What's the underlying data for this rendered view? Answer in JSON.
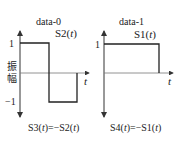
{
  "diagram": {
    "panels": [
      {
        "title": "data-0",
        "signal_label": "S2(t)",
        "signal_name": "S2",
        "signal_var": "t",
        "complement_label": "S3(t)=−S2(t)",
        "y_label": "振幅",
        "y_ticks": [
          "1",
          "−1"
        ],
        "x_label": "t",
        "waveform": [
          {
            "from": 0,
            "to": 0.5,
            "level": 1
          },
          {
            "from": 0.5,
            "to": 1,
            "level": -1
          }
        ]
      },
      {
        "title": "data-1",
        "signal_label": "S1(t)",
        "signal_name": "S1",
        "signal_var": "t",
        "complement_label": "S4(t)=−S1(t)",
        "y_ticks": [
          "1"
        ],
        "x_label": "t",
        "waveform": [
          {
            "from": 0,
            "to": 1,
            "level": 1
          }
        ]
      }
    ],
    "colors": {
      "line": "#222222",
      "axis": "#444444"
    }
  },
  "text": {
    "p0_title": "data-0",
    "p0_sig_name": "S2(",
    "p0_sig_var": "t",
    "p0_sig_close": ")",
    "p0_comp_a": "S3(",
    "p0_comp_b": "t",
    "p0_comp_c": ")=−S2(",
    "p0_comp_d": "t",
    "p0_comp_e": ")",
    "p0_y1": "1",
    "p0_ym1": "−1",
    "p0_ylab1": "振",
    "p0_ylab2": "幅",
    "p0_x": "t",
    "p1_title": "data-1",
    "p1_sig_name": "S1(",
    "p1_sig_var": "t",
    "p1_sig_close": ")",
    "p1_comp_a": "S4(",
    "p1_comp_b": "t",
    "p1_comp_c": ")=−S1(",
    "p1_comp_d": "t",
    "p1_comp_e": ")",
    "p1_y1": "1",
    "p1_x": "t"
  }
}
